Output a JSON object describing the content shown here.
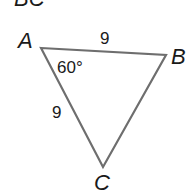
{
  "heading": {
    "text": "BC"
  },
  "triangle": {
    "stroke_color": "#6e6e6e",
    "label_color": "#1a1a1a",
    "vertices": {
      "A": {
        "label": "A",
        "x": 41,
        "y": 48
      },
      "B": {
        "label": "B",
        "x": 166,
        "y": 55
      },
      "C": {
        "label": "C",
        "x": 103,
        "y": 167
      }
    },
    "side_AB": {
      "label": "9"
    },
    "side_AC": {
      "label": "9"
    },
    "angle_A": {
      "label": "60°"
    }
  }
}
